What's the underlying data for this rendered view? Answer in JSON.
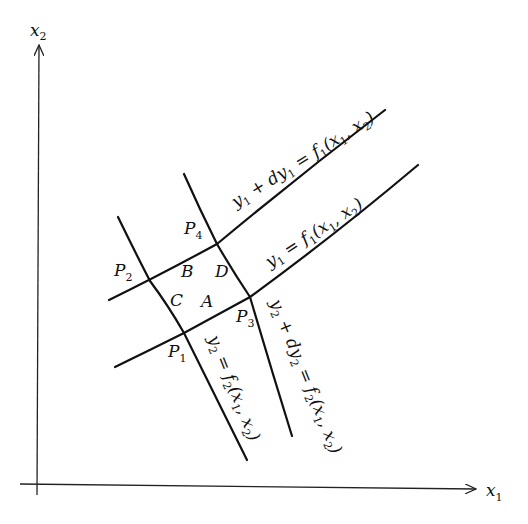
{
  "axes": {
    "x_label": "x",
    "x_sub": "1",
    "y_label": "x",
    "y_sub": "2"
  },
  "curves": {
    "y1_dy1": {
      "lhs": "y",
      "lhs_sub": "1",
      "mid": " + dy",
      "mid_sub": "1",
      "rhs": " = f",
      "rhs_sub": "1",
      "args_open": "(x",
      "a1_sub": "1",
      "comma": ", x",
      "a2_sub": "2",
      "close": ")"
    },
    "y1": {
      "lhs": "y",
      "lhs_sub": "1",
      "rhs": " = f",
      "rhs_sub": "1",
      "args_open": "(x",
      "a1_sub": "1",
      "comma": ", x",
      "a2_sub": "2",
      "close": ")"
    },
    "y2": {
      "lhs": "y",
      "lhs_sub": "2",
      "rhs": " = f",
      "rhs_sub": "2",
      "args_open": "(x",
      "a1_sub": "1",
      "comma": ", x",
      "a2_sub": "2",
      "close": ")"
    },
    "y2_dy2": {
      "lhs": "y",
      "lhs_sub": "2",
      "mid": " + dy",
      "mid_sub": "2",
      "rhs": " = f",
      "rhs_sub": "2",
      "args_open": "(x",
      "a1_sub": "1",
      "comma": ", x",
      "a2_sub": "2",
      "close": ")"
    }
  },
  "points": [
    {
      "name": "P",
      "sub": "1"
    },
    {
      "name": "P",
      "sub": "2"
    },
    {
      "name": "P",
      "sub": "3"
    },
    {
      "name": "P",
      "sub": "4"
    }
  ],
  "regions": [
    "A",
    "B",
    "C",
    "D"
  ]
}
